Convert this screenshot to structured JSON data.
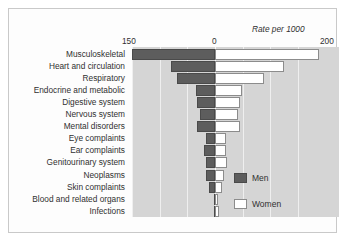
{
  "chart_data": {
    "type": "bar",
    "orientation": "horizontal-diverging",
    "title": "",
    "axis_title": "Rate per 1000",
    "xlabel": "Rate per 1000",
    "ylabel": "",
    "grid": true,
    "legend_position": "bottom-right",
    "left_axis_max": 150,
    "right_axis_max": 200,
    "tick_labels": [
      "150",
      "0",
      "200"
    ],
    "gridline_values_left": [
      150,
      100,
      50
    ],
    "gridline_values_right": [
      50,
      100,
      150
    ],
    "categories": [
      "Musculoskeletal",
      "Heart and circulation",
      "Respiratory",
      "Endocrine and metabolic",
      "Digestive system",
      "Nervous system",
      "Mental disorders",
      "Eye complaints",
      "Ear complaints",
      "Genitourinary system",
      "Neoplasms",
      "Skin complaints",
      "Blood and related organs",
      "Infections"
    ],
    "series": [
      {
        "name": "Men",
        "color": "#5d5d5d",
        "direction": "left",
        "values": [
          150,
          80,
          68,
          34,
          32,
          28,
          32,
          17,
          19,
          17,
          16,
          10,
          2,
          1
        ]
      },
      {
        "name": "Women",
        "color": "#ffffff",
        "direction": "right",
        "values": [
          188,
          124,
          88,
          48,
          45,
          42,
          45,
          20,
          20,
          22,
          17,
          12,
          6,
          7
        ]
      }
    ]
  },
  "legend": {
    "items": [
      {
        "label": "Men"
      },
      {
        "label": "Women"
      }
    ]
  },
  "colors": {
    "men": "#5d5d5d",
    "women": "#ffffff",
    "plot_background": "#d5d5d5",
    "gridline": "#efefef",
    "text": "#303030",
    "card_background": "#fdfdfd",
    "card_border": "#c9c9c9"
  }
}
